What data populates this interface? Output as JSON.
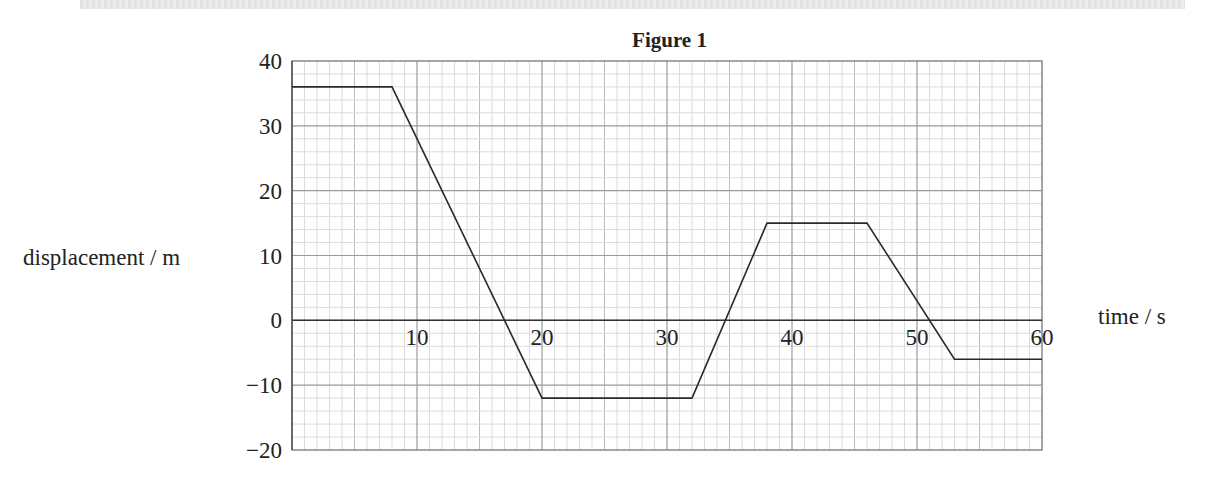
{
  "chart_data": {
    "type": "line",
    "title": "Figure 1",
    "xlabel": "time / s",
    "ylabel": "displacement / m",
    "xlim": [
      0,
      60
    ],
    "ylim": [
      -20,
      40
    ],
    "x_ticks": [
      10,
      20,
      30,
      40,
      50,
      60
    ],
    "y_ticks": [
      40,
      30,
      20,
      10,
      0,
      -10,
      -20
    ],
    "x_tick_labels": [
      "10",
      "20",
      "30",
      "40",
      "50",
      "60"
    ],
    "y_tick_labels": [
      "40",
      "30",
      "20",
      "10",
      "0",
      "−10",
      "−20"
    ],
    "grid": true,
    "grid_minor": {
      "x_step": 1,
      "y_step": 2
    },
    "series": [
      {
        "name": "displacement",
        "points": [
          [
            0,
            36
          ],
          [
            8,
            36
          ],
          [
            20,
            -12
          ],
          [
            32,
            -12
          ],
          [
            38,
            15
          ],
          [
            46,
            15
          ],
          [
            53,
            -6
          ],
          [
            60,
            -6
          ]
        ]
      }
    ],
    "x": [
      0,
      8,
      20,
      32,
      38,
      46,
      53,
      60
    ],
    "values": [
      36,
      36,
      -12,
      -12,
      15,
      15,
      -6,
      -6
    ],
    "legend": null
  },
  "figure": {
    "title": "Figure 1",
    "xlabel": "time / s",
    "ylabel": "displacement / m"
  },
  "colors": {
    "line": "#2a2a2a",
    "grid_minor": "#dcdcdc",
    "grid_major": "#9a9a9a",
    "axis": "#333333"
  }
}
